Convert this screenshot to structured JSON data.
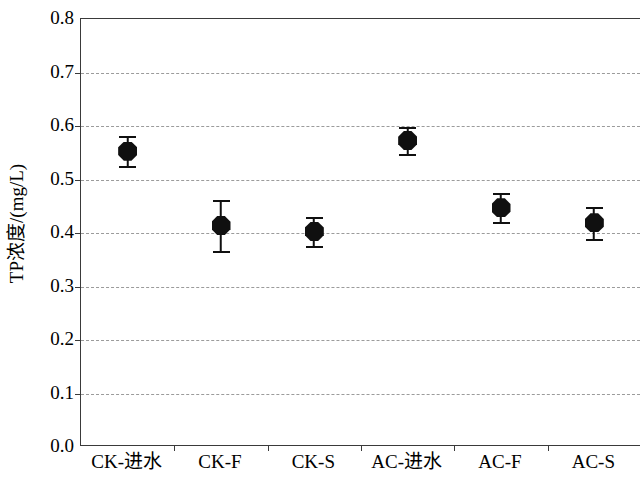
{
  "chart_data": {
    "type": "scatter",
    "title": "",
    "subtitle": "",
    "xlabel": "",
    "ylabel": "TP浓度/(mg/L)",
    "categories": [
      "CK-进水",
      "CK-F",
      "CK-S",
      "AC-进水",
      "AC-F",
      "AC-S"
    ],
    "values": [
      0.553,
      0.414,
      0.403,
      0.573,
      0.447,
      0.419
    ],
    "error_upper": [
      0.028,
      0.047,
      0.026,
      0.025,
      0.028,
      0.03
    ],
    "error_lower": [
      0.028,
      0.048,
      0.027,
      0.025,
      0.027,
      0.03
    ],
    "series": [
      {
        "name": "TP",
        "values": [
          0.553,
          0.414,
          0.403,
          0.573,
          0.447,
          0.419
        ],
        "error_upper": [
          0.028,
          0.047,
          0.026,
          0.025,
          0.028,
          0.03
        ],
        "error_lower": [
          0.028,
          0.048,
          0.027,
          0.025,
          0.027,
          0.03
        ]
      }
    ],
    "ylim": [
      0.0,
      0.8
    ],
    "ytick_labels": [
      "0.0",
      "0.1",
      "0.2",
      "0.3",
      "0.4",
      "0.5",
      "0.6",
      "0.7",
      "0.8"
    ],
    "ytick_values": [
      0.0,
      0.1,
      0.2,
      0.3,
      0.4,
      0.5,
      0.6,
      0.7,
      0.8
    ],
    "grid": true,
    "grid_axis": "y",
    "grid_style": "dashed",
    "legend": false,
    "legend_position": "none",
    "marker": "octagon",
    "marker_color": "#101010",
    "errorbar_color": "#101010",
    "axis_color": "#3a3a3a",
    "grid_color": "#9b9b9b",
    "background": "#ffffff"
  }
}
